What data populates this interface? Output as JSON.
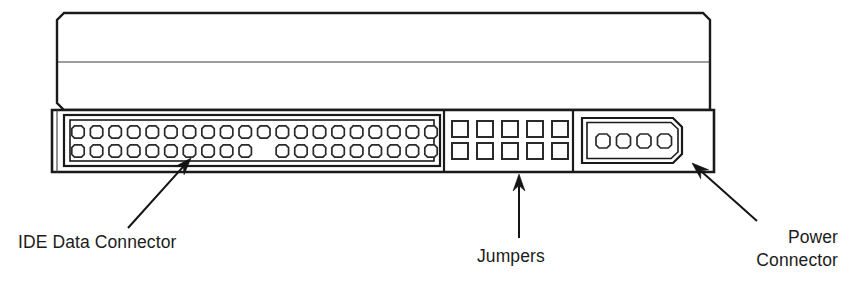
{
  "figure": {
    "background_color": "#ffffff",
    "line_color": "#1a1a1a"
  },
  "callouts": [
    {
      "id": "ide-data-connector",
      "label": "IDE Data Connector",
      "lines": [
        "IDE Data Connector"
      ],
      "text_x": 18,
      "text_y": 248,
      "align": "start",
      "arrow": {
        "tail_x": 128,
        "tail_y": 228,
        "tip_x": 191,
        "tip_y": 158
      }
    },
    {
      "id": "jumpers",
      "label": "Jumpers",
      "lines": [
        "Jumpers"
      ],
      "text_x": 477,
      "text_y": 262,
      "align": "start",
      "arrow": {
        "tail_x": 519,
        "tail_y": 238,
        "tip_x": 519,
        "tip_y": 174
      }
    },
    {
      "id": "power-connector",
      "label": "Power Connector",
      "lines": [
        "Power",
        "Connector"
      ],
      "text_x": 838,
      "text_y": 243,
      "align": "end",
      "arrow": {
        "tail_x": 757,
        "tail_y": 221,
        "tip_x": 692,
        "tip_y": 163
      }
    }
  ],
  "drive_body": {
    "left": 57,
    "right": 710,
    "top": 13,
    "seam_y": 62,
    "panel_top": 110,
    "panel_bottom": 172,
    "corner_radius": 7
  },
  "ide_connector": {
    "name": "IDE Data Connector",
    "pin_count_total": 39,
    "rows": 2,
    "pins_per_row": 20,
    "top_row_pins": 20,
    "bottom_row_pins": 19,
    "missing_pin_index": 10,
    "note": "Pin 20 removed for keying",
    "box_x": 68,
    "box_y": 118,
    "box_w": 375,
    "box_h": 45,
    "pin_shape": "round",
    "pin_radius": 6.2
  },
  "jumper_block": {
    "name": "Jumpers",
    "columns": 5,
    "rows": 2,
    "pin_count_total": 10,
    "pin_shape": "square",
    "pin_size": 16,
    "start_x": 452,
    "start_y": 121,
    "col_gap": 25,
    "row_gap": 22
  },
  "power_connector": {
    "name": "Power Connector",
    "pin_count": 4,
    "pin_shape": "round",
    "housing_shape": "trapezoid-chamfered",
    "box_x": 582,
    "box_y": 118,
    "box_w": 100,
    "box_h": 45,
    "chamfer": 9,
    "pin_radius": 7.0,
    "pin_start_x": 603,
    "pin_spacing": 20.5,
    "pin_center_y": 141
  },
  "region_dividers": {
    "ide_to_jumper_x": 444,
    "jumper_to_power_x": 573
  }
}
